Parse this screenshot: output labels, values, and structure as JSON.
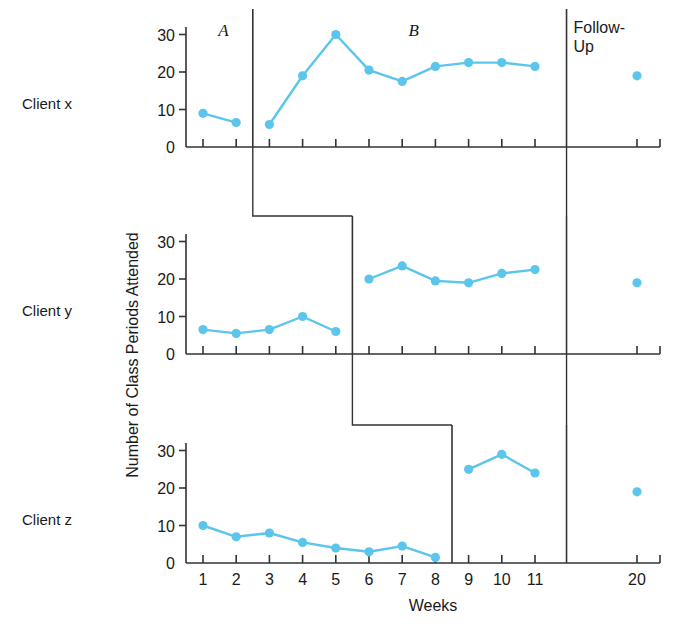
{
  "figure": {
    "xlabel": "Weeks",
    "ylabel": "Number of Class Periods Attended",
    "phase_labels": {
      "baseline": "A",
      "intervention": "B",
      "followup_line1": "Follow-",
      "followup_line2": "Up"
    },
    "panel_labels": [
      "Client x",
      "Client y",
      "Client z"
    ],
    "accent_color": "#5BC5EB",
    "axis_color": "#333333"
  },
  "chart_data": {
    "type": "line",
    "title": "",
    "subtitle": "",
    "xlabel": "Weeks",
    "ylabel": "Number of Class Periods Attended",
    "xlim": [
      0.4,
      11.8
    ],
    "ylim": [
      0,
      32
    ],
    "yticks": [
      0,
      10,
      20,
      30
    ],
    "ytick_labels": [
      "0",
      "10",
      "20",
      "30"
    ],
    "x": [
      1,
      2,
      3,
      4,
      5,
      6,
      7,
      8,
      9,
      10,
      11,
      20
    ],
    "xtick_labels": [
      "1",
      "2",
      "3",
      "4",
      "5",
      "6",
      "7",
      "8",
      "9",
      "10",
      "11",
      "20"
    ],
    "grid": false,
    "legend": "none",
    "design": "multiple-baseline across subjects",
    "annotations": [
      {
        "text": "A",
        "meaning": "baseline phase"
      },
      {
        "text": "B",
        "meaning": "intervention phase"
      },
      {
        "text": "Follow-Up",
        "meaning": "follow-up probe at week 20"
      }
    ],
    "panels": [
      {
        "name": "Client x",
        "baseline_end_week": 2,
        "intervention_start_week": 3,
        "followup_week": 20,
        "series": [
          {
            "name": "A (baseline)",
            "x": [
              1,
              2
            ],
            "values": [
              9,
              6.5
            ]
          },
          {
            "name": "B (intervention)",
            "x": [
              3,
              4,
              5,
              6,
              7,
              8,
              9,
              10,
              11
            ],
            "values": [
              6,
              19,
              30,
              20.5,
              17.5,
              21.5,
              22.5,
              22.5,
              21.5
            ]
          },
          {
            "name": "Follow-Up",
            "x": [
              20
            ],
            "values": [
              19
            ]
          }
        ]
      },
      {
        "name": "Client y",
        "baseline_end_week": 5,
        "intervention_start_week": 6,
        "followup_week": 20,
        "series": [
          {
            "name": "A (baseline)",
            "x": [
              1,
              2,
              3,
              4,
              5
            ],
            "values": [
              6.5,
              5.5,
              6.5,
              10,
              6
            ]
          },
          {
            "name": "B (intervention)",
            "x": [
              6,
              7,
              8,
              9,
              10,
              11
            ],
            "values": [
              20,
              23.5,
              19.5,
              19,
              21.5,
              22.5
            ]
          },
          {
            "name": "Follow-Up",
            "x": [
              20
            ],
            "values": [
              19
            ]
          }
        ]
      },
      {
        "name": "Client z",
        "baseline_end_week": 8,
        "intervention_start_week": 9,
        "followup_week": 20,
        "series": [
          {
            "name": "A (baseline)",
            "x": [
              1,
              2,
              3,
              4,
              5,
              6,
              7,
              8
            ],
            "values": [
              10,
              7,
              8,
              5.5,
              4,
              3,
              4.5,
              1.5
            ]
          },
          {
            "name": "B (intervention)",
            "x": [
              9,
              10,
              11
            ],
            "values": [
              25,
              29,
              24
            ]
          },
          {
            "name": "Follow-Up",
            "x": [
              20
            ],
            "values": [
              19
            ]
          }
        ]
      }
    ]
  }
}
